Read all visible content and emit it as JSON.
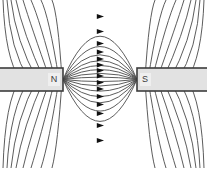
{
  "figure": {
    "background_color": "#ffffff",
    "width": 207,
    "height": 168
  },
  "magnets": {
    "left": {
      "pole_label": "N",
      "pole_name": "north-pole",
      "x": 0,
      "y": 68,
      "width": 63,
      "height": 23,
      "body_color": "#e2e2e2",
      "edge_color": "#3c3c3c",
      "label_x": 54,
      "label_y": 79.5,
      "label_box": {
        "x": 48,
        "y": 73,
        "width": 12,
        "height": 13,
        "fill": "#efefef"
      }
    },
    "right": {
      "pole_label": "S",
      "pole_name": "south-pole",
      "x": 137,
      "y": 68,
      "width": 70,
      "height": 23,
      "body_color": "#e2e2e2",
      "edge_color": "#3c3c3c",
      "label_x": 145,
      "label_y": 79.5,
      "label_box": {
        "x": 140,
        "y": 73,
        "width": 11,
        "height": 13,
        "fill": "#efefef"
      }
    }
  },
  "field": {
    "line_color": "#4a4a4a",
    "line_width": 0.9,
    "arrow_color": "#111111",
    "arrow_direction": "left-to-right",
    "gap_left_x": 63,
    "gap_right_x": 137,
    "axis_y": 79.5,
    "arrow_x": 100,
    "inner_arc_count": 13,
    "outer_line_count_per_side": 8,
    "inner_arcs": [
      {
        "id": "arc-1",
        "bulge": 63.0,
        "arrow_y": 16.5
      },
      {
        "id": "arc-2",
        "bulge": 48.0,
        "arrow_y": 31.5
      },
      {
        "id": "arc-3",
        "bulge": 36.0,
        "arrow_y": 43.5
      },
      {
        "id": "arc-4",
        "bulge": 27.5,
        "arrow_y": 52.0
      },
      {
        "id": "arc-5",
        "bulge": 20.5,
        "arrow_y": 59.0
      },
      {
        "id": "arc-6",
        "bulge": 14.5,
        "arrow_y": 65.0
      },
      {
        "id": "arc-7",
        "bulge": 9.0,
        "arrow_y": 70.5
      },
      {
        "id": "arc-8",
        "bulge": 3.5,
        "arrow_y": 76.0
      },
      {
        "id": "arc-9",
        "bulge": -3.0,
        "arrow_y": 82.5
      },
      {
        "id": "arc-10",
        "bulge": -9.5,
        "arrow_y": 89.0
      },
      {
        "id": "arc-11",
        "bulge": -17.0,
        "arrow_y": 96.5
      },
      {
        "id": "arc-12",
        "bulge": -25.0,
        "arrow_y": 104.5
      },
      {
        "id": "arc-13",
        "bulge": -34.0,
        "arrow_y": 113.5
      },
      {
        "id": "arc-14",
        "bulge": -46.0,
        "arrow_y": 125.5
      },
      {
        "id": "arc-15",
        "bulge": -61.0,
        "arrow_y": 140.5
      }
    ],
    "outer_lines_top_left": [
      {
        "id": "otl-1",
        "start_x": 62,
        "ctrl_x": 58,
        "ctrl_y": 14,
        "end_x": 52,
        "end_y": 0
      },
      {
        "id": "otl-2",
        "start_x": 59,
        "ctrl_x": 49,
        "ctrl_y": 16,
        "end_x": 41,
        "end_y": 0
      },
      {
        "id": "otl-3",
        "start_x": 55,
        "ctrl_x": 40,
        "ctrl_y": 20,
        "end_x": 31,
        "end_y": 0
      },
      {
        "id": "otl-4",
        "start_x": 50,
        "ctrl_x": 31,
        "ctrl_y": 26,
        "end_x": 23,
        "end_y": 0
      },
      {
        "id": "otl-5",
        "start_x": 44,
        "ctrl_x": 23,
        "ctrl_y": 33,
        "end_x": 16,
        "end_y": 0
      },
      {
        "id": "otl-6",
        "start_x": 37,
        "ctrl_x": 16,
        "ctrl_y": 41,
        "end_x": 11,
        "end_y": 0
      },
      {
        "id": "otl-7",
        "start_x": 29,
        "ctrl_x": 10,
        "ctrl_y": 50,
        "end_x": 7,
        "end_y": 0
      },
      {
        "id": "otl-8",
        "start_x": 20,
        "ctrl_x": 5,
        "ctrl_y": 58,
        "end_x": 3,
        "end_y": 0
      }
    ]
  },
  "colors": {
    "stroke": "#4a4a4a",
    "magnet_fill": "#e2e2e2",
    "magnet_edge": "#3c3c3c",
    "label_text": "#3a3a3a",
    "arrow": "#111111",
    "background": "#ffffff"
  }
}
